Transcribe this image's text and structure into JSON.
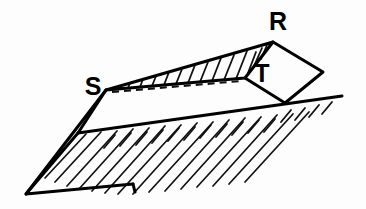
{
  "figure": {
    "kind": "line-art-geometry-diagram",
    "background_color": "#fdfdfd",
    "ink_color": "#000000",
    "width": 366,
    "height": 209
  },
  "labels": [
    {
      "name": "vertex-label-r",
      "text": "R",
      "x": 278,
      "y": 30,
      "font_size": 25
    },
    {
      "name": "vertex-label-t",
      "text": "T",
      "x": 262,
      "y": 82,
      "font_size": 25
    },
    {
      "name": "vertex-label-s",
      "text": "S",
      "x": 93,
      "y": 95,
      "font_size": 25
    }
  ],
  "points": {
    "S": {
      "x": 106,
      "y": 90
    },
    "R": {
      "x": 273,
      "y": 42
    },
    "T": {
      "x": 245,
      "y": 78
    },
    "rhombus_right": {
      "x": 323,
      "y": 72
    },
    "rhombus_bottom": {
      "x": 285,
      "y": 103
    },
    "plane_left_apex": {
      "x": 78,
      "y": 133
    },
    "plane_bottom_left": {
      "x": 26,
      "y": 194
    },
    "plane_bottom_right": {
      "x": 133,
      "y": 184
    },
    "ground_right_end": {
      "x": 342,
      "y": 96
    }
  },
  "strokes": {
    "outline_width": 3.0,
    "hatch_width": 1.7,
    "dash_width": 2.0,
    "dash_pattern": "7 5"
  },
  "regions": [
    {
      "name": "upper-hatched-wedge",
      "description": "Triangle S-R-T filled with near-vertical hatch lines",
      "hatch_count": 13,
      "hatch_direction": "near-vertical"
    },
    {
      "name": "lower-hatched-plane",
      "description": "Inclined plane band hatched with parallel lines running down-right",
      "hatch_count": 15,
      "hatch_direction": "down-right-steep"
    },
    {
      "name": "ground-line-hatch",
      "description": "Short tick hatches below the ground line to the right of T",
      "hatch_count": 13,
      "hatch_direction": "down-left-short"
    },
    {
      "name": "rhombus-RT",
      "description": "Unfilled rhombus with top vertex R and left vertex T"
    }
  ]
}
